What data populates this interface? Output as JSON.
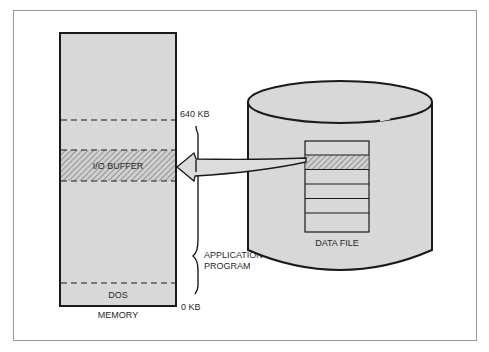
{
  "diagram": {
    "memory": {
      "label": "MEMORY",
      "regions": [
        {
          "name": "upper-memory",
          "label": ""
        },
        {
          "name": "io-buffer",
          "label": "I/O BUFFER"
        },
        {
          "name": "application-program",
          "label": ""
        },
        {
          "name": "dos",
          "label": "DOS"
        }
      ],
      "markers": {
        "top": "640 KB",
        "bottom": "0 KB"
      }
    },
    "brace": {
      "label_line1": "APPLICATION",
      "label_line2": "PROGRAM"
    },
    "disk": {
      "file_label": "DATA FILE",
      "record_count": 6,
      "highlighted_record": 2
    },
    "arrow": {
      "from": "DATA FILE record",
      "to": "I/O BUFFER"
    },
    "colors": {
      "fill": "#d8d8d8",
      "stroke": "#1a1a1a",
      "frame": "#9a9a9a",
      "hatch": "#6a6a6a"
    }
  }
}
